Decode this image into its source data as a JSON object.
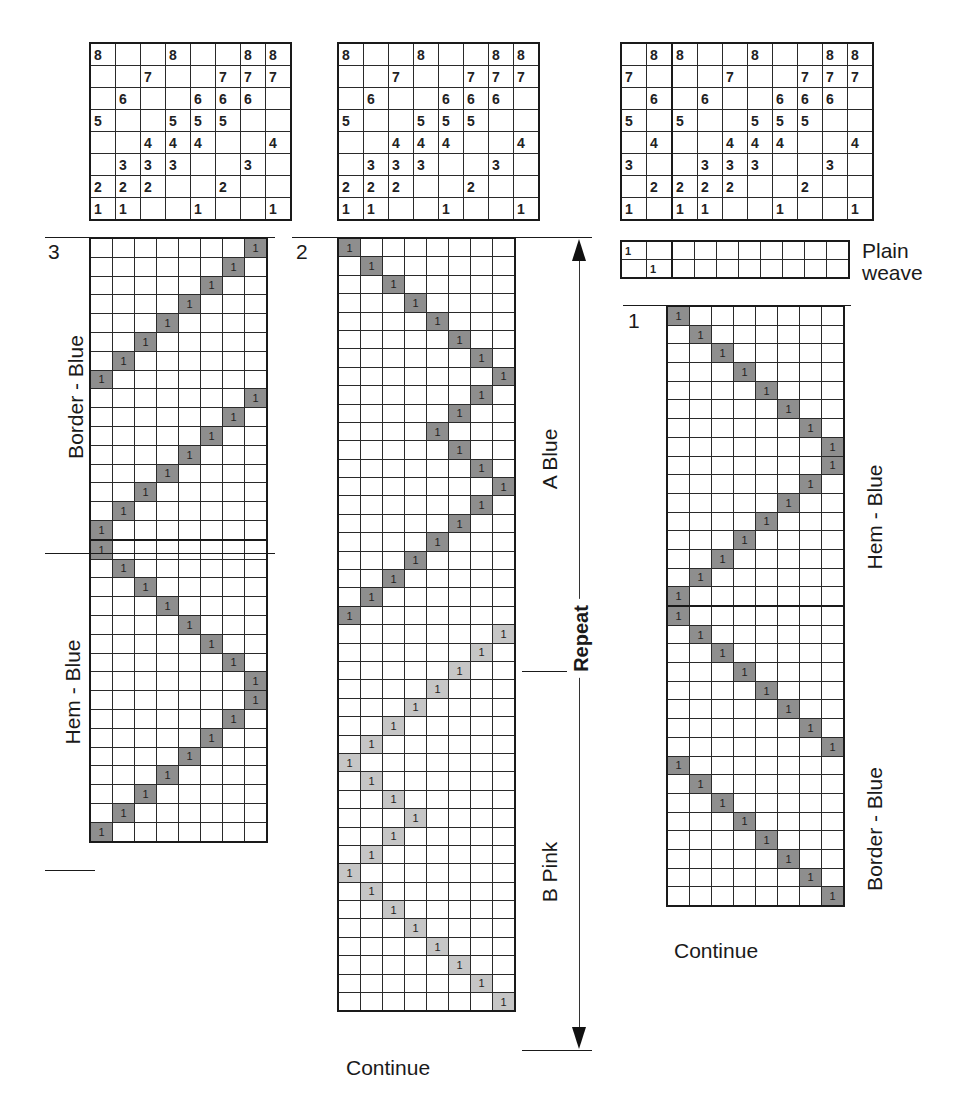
{
  "tieups": {
    "left": {
      "rows": [
        [
          "8",
          "",
          "",
          "8",
          "",
          "",
          "8",
          "8"
        ],
        [
          "",
          "",
          "7",
          "",
          "",
          "7",
          "7",
          "7"
        ],
        [
          "",
          "6",
          "",
          "",
          "6",
          "6",
          "6",
          ""
        ],
        [
          "5",
          "",
          "",
          "5",
          "5",
          "5",
          "",
          ""
        ],
        [
          "",
          "",
          "4",
          "4",
          "4",
          "",
          "",
          "4"
        ],
        [
          "",
          "3",
          "3",
          "3",
          "",
          "",
          "3",
          ""
        ],
        [
          "2",
          "2",
          "2",
          "",
          "",
          "2",
          "",
          ""
        ],
        [
          "1",
          "1",
          "",
          "",
          "1",
          "",
          "",
          "1"
        ]
      ]
    },
    "middle": {
      "rows": [
        [
          "8",
          "",
          "",
          "8",
          "",
          "",
          "8",
          "8"
        ],
        [
          "",
          "",
          "7",
          "",
          "",
          "7",
          "7",
          "7"
        ],
        [
          "",
          "6",
          "",
          "",
          "6",
          "6",
          "6",
          ""
        ],
        [
          "5",
          "",
          "",
          "5",
          "5",
          "5",
          "",
          ""
        ],
        [
          "",
          "",
          "4",
          "4",
          "4",
          "",
          "",
          "4"
        ],
        [
          "",
          "3",
          "3",
          "3",
          "",
          "",
          "3",
          ""
        ],
        [
          "2",
          "2",
          "2",
          "",
          "",
          "2",
          "",
          ""
        ],
        [
          "1",
          "1",
          "",
          "",
          "1",
          "",
          "",
          "1"
        ]
      ]
    },
    "right": {
      "rows": [
        [
          "",
          "8",
          "8",
          "",
          "",
          "8",
          "",
          "",
          "8",
          "8"
        ],
        [
          "7",
          "",
          "",
          "",
          "7",
          "",
          "",
          "7",
          "7",
          "7"
        ],
        [
          "",
          "6",
          "",
          "6",
          "",
          "",
          "6",
          "6",
          "6",
          ""
        ],
        [
          "5",
          "",
          "5",
          "",
          "",
          "5",
          "5",
          "5",
          "",
          ""
        ],
        [
          "",
          "4",
          "",
          "",
          "4",
          "4",
          "4",
          "",
          "",
          "4"
        ],
        [
          "3",
          "",
          "",
          "3",
          "3",
          "3",
          "",
          "",
          "3",
          ""
        ],
        [
          "",
          "2",
          "2",
          "2",
          "2",
          "",
          "",
          "2",
          "",
          ""
        ],
        [
          "1",
          "",
          "1",
          "1",
          "",
          "",
          "1",
          "",
          "",
          "1"
        ]
      ]
    }
  },
  "treadlings": {
    "left": {
      "number": "3",
      "cell_mark": "1",
      "sections": [
        {
          "label": "Border - Blue",
          "shade": "blue",
          "cols": [
            8,
            7,
            6,
            5,
            4,
            3,
            2,
            1,
            8,
            7,
            6,
            5,
            4,
            3,
            2,
            1
          ]
        },
        {
          "label": "Hem - Blue",
          "shade": "blue",
          "cols": [
            1,
            2,
            3,
            4,
            5,
            6,
            7,
            8,
            8,
            7,
            6,
            5,
            4,
            3,
            2,
            1
          ]
        }
      ]
    },
    "middle": {
      "number": "2",
      "cell_mark": "1",
      "sections": [
        {
          "label": "A Blue",
          "shade": "blue",
          "cols": [
            1,
            2,
            3,
            4,
            5,
            6,
            7,
            8,
            7,
            6,
            5,
            6,
            7,
            8,
            7,
            6,
            5,
            4,
            3,
            2,
            1
          ]
        },
        {
          "label": "B Pink",
          "shade": "pink",
          "cols": [
            8,
            7,
            6,
            5,
            4,
            3,
            2,
            1,
            2,
            3,
            4,
            3,
            2,
            1,
            2,
            3,
            4,
            5,
            6,
            7,
            8
          ]
        }
      ],
      "continue_label": "Continue",
      "repeat_label": "Repeat"
    },
    "right": {
      "number": "1",
      "cell_mark": "1",
      "plain_weave": {
        "label_line1": "Plain",
        "label_line2": "weave",
        "cols": [
          1,
          2
        ]
      },
      "sections": [
        {
          "label": "Hem - Blue",
          "shade": "blue",
          "cols": [
            1,
            2,
            3,
            4,
            5,
            6,
            7,
            8,
            8,
            7,
            6,
            5,
            4,
            3,
            2,
            1
          ]
        },
        {
          "label": "Border - Blue",
          "shade": "blue",
          "cols": [
            1,
            2,
            3,
            4,
            5,
            6,
            7,
            8,
            1,
            2,
            3,
            4,
            5,
            6,
            7,
            8
          ]
        }
      ],
      "continue_label": "Continue"
    }
  },
  "colors": {
    "blue_shade": "#8e8e8e",
    "pink_shade": "#c6c6c6",
    "line": "#1a1a1a"
  }
}
